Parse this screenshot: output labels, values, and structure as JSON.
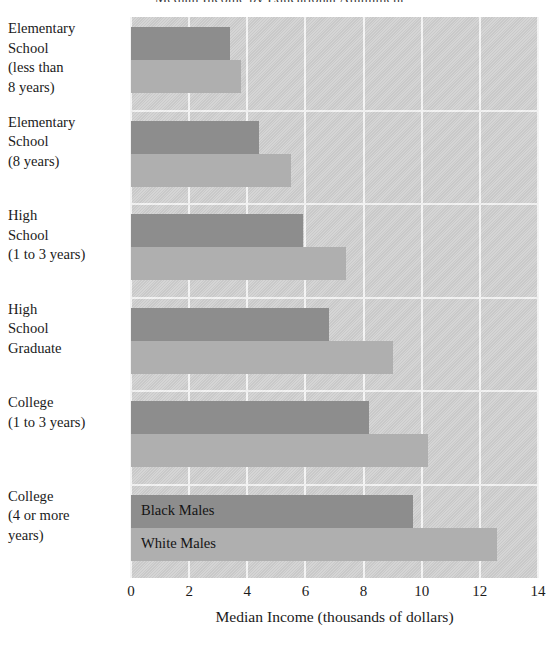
{
  "chart_data": {
    "type": "bar",
    "orientation": "horizontal",
    "title": "Median Income by Educational Attainment",
    "xlabel": "Median Income (thousands of dollars)",
    "ylabel": "",
    "xlim": [
      0,
      14
    ],
    "xticks": [
      "0",
      "2",
      "4",
      "6",
      "8",
      "10",
      "12",
      "14"
    ],
    "xtick_values": [
      0,
      2,
      4,
      6,
      8,
      10,
      12,
      14
    ],
    "grid": "vertical white gridlines on gray panel",
    "legend_position": "inline labels inside bottom group",
    "categories": [
      "Elementary School (less than 8 years)",
      "Elementary School (8 years)",
      "High School (1 to 3 years)",
      "High School Graduate",
      "College (1 to 3 years)",
      "College (4 or more years)"
    ],
    "category_lines": [
      [
        "Elementary",
        "School",
        "(less than",
        "8 years)"
      ],
      [
        "Elementary",
        "School",
        "(8 years)"
      ],
      [
        "High",
        "School",
        "(1 to 3 years)"
      ],
      [
        "High",
        "School",
        "Graduate"
      ],
      [
        "College",
        "(1 to 3 years)"
      ],
      [
        "College",
        "(4 or more",
        "years)"
      ]
    ],
    "series": [
      {
        "name": "Black Males",
        "color": "#8d8d8d",
        "values": [
          3.4,
          4.4,
          5.9,
          6.8,
          8.2,
          9.7
        ]
      },
      {
        "name": "White Males",
        "color": "#afafaf",
        "values": [
          3.8,
          5.5,
          7.4,
          9.0,
          10.2,
          12.6
        ]
      }
    ]
  },
  "colors": {
    "panel_background": "#cdcdcd",
    "gridline": "#f4f4f4",
    "black_males_bar": "#8d8d8d",
    "white_males_bar": "#afafaf",
    "text": "#1b1b1b"
  }
}
